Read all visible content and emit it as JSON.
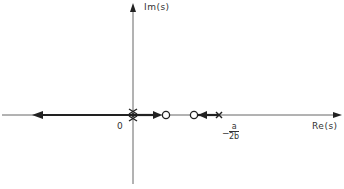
{
  "diagram": {
    "type": "root-locus",
    "axes": {
      "imag_label": "Im(s)",
      "real_label": "Re(s)",
      "origin_label": "0"
    },
    "marker_label": {
      "sign": "−",
      "numerator": "a",
      "denominator": "2b"
    },
    "poles": [
      {
        "name": "origin-pole",
        "position": "0",
        "multiplicity": 2
      },
      {
        "name": "pole-minus-a-over-2b",
        "position": "-a/2b"
      }
    ],
    "zeros": [
      {
        "name": "zero-1"
      },
      {
        "name": "zero-2"
      }
    ],
    "branches": [
      {
        "name": "branch-left",
        "direction": "from origin to -infinity"
      },
      {
        "name": "branch-origin-to-zero1",
        "direction": "from origin toward zero-1"
      },
      {
        "name": "branch-pole-to-zero2",
        "direction": "from pole at -a/2b toward zero-2"
      }
    ],
    "colors": {
      "axis": "#555555",
      "locus": "#222222"
    }
  }
}
